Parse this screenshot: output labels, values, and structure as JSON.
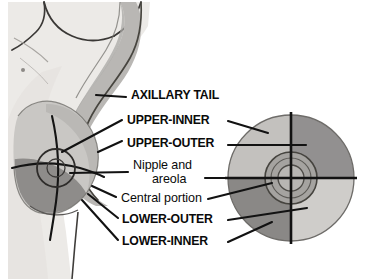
{
  "figure": {
    "background_color": "#ffffff",
    "width": 366,
    "height": 279
  },
  "labels": {
    "axillary_tail": "AXILLARY TAIL",
    "upper_inner": "UPPER-INNER",
    "upper_outer": "UPPER-OUTER",
    "nipple_line1": "Nipple and",
    "nipple_line2": "areola",
    "central_portion": "Central portion",
    "lower_outer": "LOWER-OUTER",
    "lower_inner": "LOWER-INNER"
  },
  "palette": {
    "line_color": "#111111",
    "text_color": "#0a0a0a",
    "torso_fill": "#eceae7",
    "torso_shadow": "#dedbd6",
    "arm_fill": "#b9b7b4",
    "arm_shadow": "#a9a7a4",
    "breast_light": "#c9c7c4",
    "breast_dark": "#8e8c8a",
    "quadrant_upper_inner": "#c3c1be",
    "quadrant_upper_outer": "#929090",
    "quadrant_lower_inner": "#8a8886",
    "quadrant_lower_outer": "#cfcdca",
    "areola_fill": "#a5a3a0",
    "nipple_fill": "#b8b6b3",
    "outline_gray": "#5a5856"
  },
  "quadrant_circle": {
    "center_x": 291,
    "center_y": 178,
    "radius": 63,
    "areola_radius": 26,
    "nipple_radius": 13,
    "regions": [
      {
        "name": "upper-inner",
        "position": "upper-left",
        "shade": "light"
      },
      {
        "name": "upper-outer",
        "position": "upper-right",
        "shade": "dark"
      },
      {
        "name": "lower-inner",
        "position": "lower-left",
        "shade": "dark"
      },
      {
        "name": "lower-outer",
        "position": "lower-right",
        "shade": "light"
      }
    ]
  },
  "profile_view": {
    "description": "Lateral torso with raised arm, breast in profile, quadrant cross-lines and areola circle"
  }
}
